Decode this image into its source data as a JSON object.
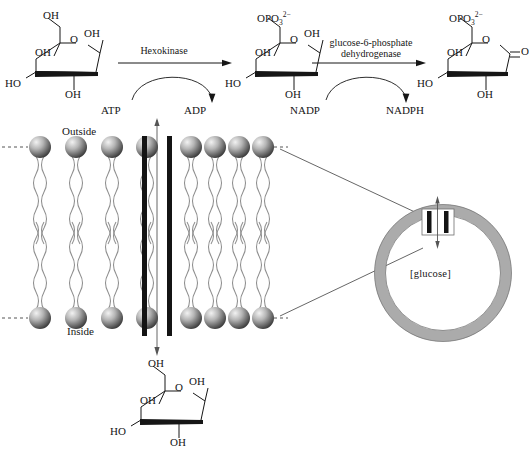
{
  "figure": {
    "type": "biochemistry-pathway-diagram"
  },
  "reaction_scheme": {
    "steps": [
      {
        "id": "step-1",
        "enzyme_lines": [
          "Hexokinase"
        ],
        "substrate_cofactor": "ATP",
        "product_cofactor": "ADP"
      },
      {
        "id": "step-2",
        "enzyme_lines": [
          "glucose-6-phosphate",
          "dehydrogenase"
        ],
        "substrate_cofactor": "NADP",
        "product_cofactor": "NADPH"
      }
    ],
    "molecules": [
      {
        "id": "glucose-top",
        "name": "glucose",
        "labels": {
          "c6": "OH",
          "ring_o": "O",
          "c1": "OH",
          "c2_left": "OH",
          "c4": "HO",
          "c3": "OH"
        }
      },
      {
        "id": "glucose-6-phosphate",
        "name": "glucose-6-phosphate",
        "labels": {
          "c6": "OPO",
          "c6_sub": "3",
          "c6_sup": "2−",
          "ring_o": "O",
          "c1": "OH",
          "c2_left": "OH",
          "c4": "HO",
          "c3": "OH"
        }
      },
      {
        "id": "phosphogluconolactone",
        "name": "6-phosphoglucono-δ-lactone",
        "labels": {
          "c6": "OPO",
          "c6_sub": "3",
          "c6_sup": "2−",
          "ring_o": "O",
          "carbonyl_o": "O",
          "c2_left": "OH",
          "c4": "HO",
          "c3": "OH"
        }
      },
      {
        "id": "glucose-bottom",
        "name": "glucose",
        "labels": {
          "c6": "OH",
          "ring_o": "O",
          "c1": "OH",
          "c2_left": "OH",
          "c4": "HO",
          "c3": "OH"
        }
      }
    ]
  },
  "membrane": {
    "outside_label": "Outside",
    "inside_label": "Inside",
    "lipids_left_count": 4,
    "lipids_right_count": 4,
    "transporter": {
      "id": "glucose-transporter",
      "direction": "inward",
      "bar_count": 2
    }
  },
  "vesicle": {
    "interior_label": "[glucose]",
    "membrane_color": "#a8a8a8",
    "transporter": {
      "id": "vesicle-transporter",
      "bar_count": 2,
      "direction": "bidirectional"
    }
  },
  "colors": {
    "stroke": "#161616",
    "lipid_head_dark": "#4a4a4a",
    "lipid_head_light": "#e8e8e8",
    "lipid_tail": "#8a8a8a",
    "vesicle_ring": "#a9a9a9",
    "background": "#ffffff"
  }
}
